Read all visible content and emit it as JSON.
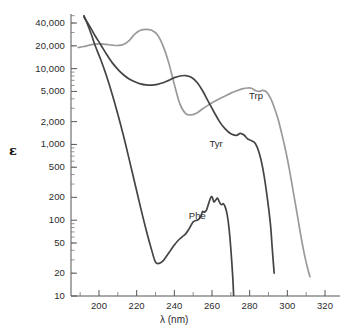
{
  "chart_data": {
    "type": "line",
    "title": "",
    "subtitle": "",
    "xlabel": "λ (nm)",
    "ylabel": "ε",
    "xlim": [
      188,
      325
    ],
    "ylim": [
      10,
      50000
    ],
    "yscale": "log",
    "xscale": "linear",
    "grid": false,
    "legend_position": "inline-annotations",
    "x_ticks": [
      200,
      220,
      240,
      260,
      280,
      300,
      320
    ],
    "x_tick_labels": [
      "200",
      "220",
      "240",
      "260",
      "280",
      "300",
      "320"
    ],
    "x_minor_ticks": [
      190,
      210,
      230,
      250,
      270,
      290,
      310
    ],
    "y_ticks": [
      10,
      20,
      50,
      100,
      200,
      500,
      1000,
      2000,
      5000,
      10000,
      20000,
      40000
    ],
    "y_tick_labels": [
      "10",
      "20",
      "50",
      "100",
      "200",
      "500",
      "1,000",
      "2,000",
      "5,000",
      "10,000",
      "20,000",
      "40,000"
    ],
    "series": [
      {
        "name": "Trp",
        "label": "Trp",
        "color": "#9a9a9a",
        "label_x": 285,
        "label_y": 4300,
        "points": [
          [
            189,
            19000
          ],
          [
            192,
            19600
          ],
          [
            195,
            20400
          ],
          [
            198,
            21000
          ],
          [
            201,
            21200
          ],
          [
            204,
            20900
          ],
          [
            207,
            20400
          ],
          [
            210,
            20200
          ],
          [
            213,
            20800
          ],
          [
            216,
            23500
          ],
          [
            219,
            28500
          ],
          [
            222,
            32000
          ],
          [
            225,
            33000
          ],
          [
            228,
            32000
          ],
          [
            231,
            28000
          ],
          [
            234,
            20000
          ],
          [
            237,
            12000
          ],
          [
            240,
            6200
          ],
          [
            243,
            3400
          ],
          [
            246,
            2550
          ],
          [
            249,
            2450
          ],
          [
            252,
            2600
          ],
          [
            255,
            2950
          ],
          [
            258,
            3300
          ],
          [
            261,
            3650
          ],
          [
            264,
            4000
          ],
          [
            267,
            4350
          ],
          [
            270,
            4750
          ],
          [
            273,
            5100
          ],
          [
            276,
            5400
          ],
          [
            279,
            5550
          ],
          [
            281,
            5500
          ],
          [
            283,
            5150
          ],
          [
            285,
            5000
          ],
          [
            287,
            5150
          ],
          [
            289,
            4900
          ],
          [
            291,
            4100
          ],
          [
            293,
            3100
          ],
          [
            295,
            2200
          ],
          [
            297,
            1400
          ],
          [
            299,
            850
          ],
          [
            301,
            480
          ],
          [
            303,
            250
          ],
          [
            305,
            130
          ],
          [
            307,
            66
          ],
          [
            309,
            36
          ],
          [
            311,
            22
          ],
          [
            312,
            18
          ]
        ]
      },
      {
        "name": "Tyr",
        "label": "Tyr",
        "color": "#444444",
        "label_x": 264,
        "label_y": 1000,
        "points": [
          [
            192,
            48000
          ],
          [
            194,
            40000
          ],
          [
            196,
            33000
          ],
          [
            198,
            27000
          ],
          [
            201,
            20500
          ],
          [
            204,
            15500
          ],
          [
            207,
            12000
          ],
          [
            210,
            9800
          ],
          [
            213,
            8300
          ],
          [
            216,
            7300
          ],
          [
            219,
            6700
          ],
          [
            222,
            6300
          ],
          [
            225,
            6100
          ],
          [
            228,
            6050
          ],
          [
            231,
            6200
          ],
          [
            234,
            6500
          ],
          [
            237,
            7000
          ],
          [
            240,
            7600
          ],
          [
            243,
            8000
          ],
          [
            246,
            8100
          ],
          [
            249,
            7700
          ],
          [
            252,
            6600
          ],
          [
            255,
            5100
          ],
          [
            258,
            3700
          ],
          [
            261,
            2700
          ],
          [
            264,
            2000
          ],
          [
            267,
            1600
          ],
          [
            270,
            1380
          ],
          [
            273,
            1320
          ],
          [
            275,
            1400
          ],
          [
            277,
            1330
          ],
          [
            279,
            1180
          ],
          [
            281,
            1120
          ],
          [
            283,
            1030
          ],
          [
            285,
            780
          ],
          [
            287,
            480
          ],
          [
            289,
            230
          ],
          [
            291,
            90
          ],
          [
            292,
            42
          ],
          [
            293,
            20
          ]
        ]
      },
      {
        "name": "Phe",
        "label": "Phe",
        "color": "#444444",
        "label_x": 253,
        "label_y": 115,
        "points": [
          [
            192,
            50000
          ],
          [
            194,
            38000
          ],
          [
            196,
            28000
          ],
          [
            198,
            20000
          ],
          [
            201,
            13000
          ],
          [
            204,
            8000
          ],
          [
            207,
            4600
          ],
          [
            210,
            2500
          ],
          [
            213,
            1300
          ],
          [
            216,
            640
          ],
          [
            219,
            310
          ],
          [
            222,
            150
          ],
          [
            225,
            75
          ],
          [
            228,
            40
          ],
          [
            230,
            28
          ],
          [
            232,
            27
          ],
          [
            234,
            29
          ],
          [
            236,
            34
          ],
          [
            238,
            40
          ],
          [
            240,
            47
          ],
          [
            242,
            54
          ],
          [
            244,
            60
          ],
          [
            246,
            66
          ],
          [
            248,
            78
          ],
          [
            250,
            95
          ],
          [
            252,
            100
          ],
          [
            253,
            103
          ],
          [
            254,
            112
          ],
          [
            255,
            130
          ],
          [
            256,
            128
          ],
          [
            257,
            135
          ],
          [
            258,
            160
          ],
          [
            259,
            190
          ],
          [
            260,
            205
          ],
          [
            261,
            175
          ],
          [
            262,
            185
          ],
          [
            263,
            195
          ],
          [
            264,
            172
          ],
          [
            265,
            160
          ],
          [
            266,
            165
          ],
          [
            267,
            150
          ],
          [
            268,
            120
          ],
          [
            269,
            80
          ],
          [
            270,
            42
          ],
          [
            271,
            18
          ],
          [
            271.5,
            10
          ]
        ]
      }
    ]
  },
  "axes": {
    "x_title": "λ (nm)",
    "y_title": "ε"
  }
}
